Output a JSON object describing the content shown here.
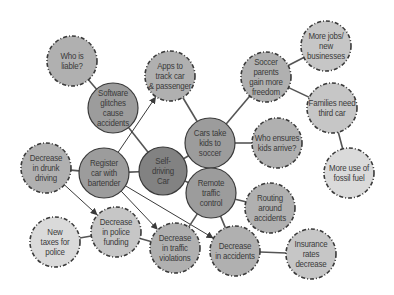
{
  "diagram": {
    "colors": {
      "background": "#ffffff",
      "center_fill": "#828282",
      "level1_fill": "#9c9c9c",
      "level2_fill": "#b0b0b0",
      "level3_fill": "#c6c6c6",
      "leaf_fill": "#dadada",
      "stroke": "#3a3a3a",
      "edge": "#555555",
      "text": "#3a3a3a"
    },
    "nodes": [
      {
        "id": "self-driving-car",
        "label": "Self-\ndriving\nCar",
        "cx": 163,
        "cy": 171,
        "r": 24,
        "level": "center",
        "dashed": false
      },
      {
        "id": "software-glitches",
        "label": "Software\nglitches\ncause\naccidents",
        "cx": 113,
        "cy": 108,
        "r": 25,
        "level": "level1",
        "dashed": false
      },
      {
        "id": "register-car",
        "label": "Register\ncar with\nbartender",
        "cx": 104,
        "cy": 173,
        "r": 25,
        "level": "level1",
        "dashed": false
      },
      {
        "id": "cars-take-kids",
        "label": "Cars take\nkids to\nsoccer",
        "cx": 210,
        "cy": 143,
        "r": 25,
        "level": "level1",
        "dashed": false
      },
      {
        "id": "remote-traffic",
        "label": "Remote\ntraffic\ncontrol",
        "cx": 211,
        "cy": 193,
        "r": 25,
        "level": "level1",
        "dashed": false
      },
      {
        "id": "who-is-liable",
        "label": "Who is\nliable?",
        "cx": 72,
        "cy": 61,
        "r": 25,
        "level": "level2",
        "dashed": true
      },
      {
        "id": "apps-to-track",
        "label": "Apps to\ntrack car\n& passenger",
        "cx": 170,
        "cy": 76,
        "r": 25,
        "level": "level2",
        "dashed": true
      },
      {
        "id": "soccer-parents",
        "label": "Soccer\nparents\ngain more\nfreedom",
        "cx": 266,
        "cy": 77,
        "r": 25,
        "level": "level2",
        "dashed": true
      },
      {
        "id": "who-ensures-kids",
        "label": "Who ensures\nkids arrive?",
        "cx": 277,
        "cy": 143,
        "r": 25,
        "level": "level2",
        "dashed": true
      },
      {
        "id": "routing-around",
        "label": "Routing\naround\naccidents",
        "cx": 270,
        "cy": 208,
        "r": 25,
        "level": "level2",
        "dashed": true
      },
      {
        "id": "decrease-drunk",
        "label": "Decrease\nin drunk\ndriving",
        "cx": 46,
        "cy": 168,
        "r": 25,
        "level": "level2",
        "dashed": true
      },
      {
        "id": "decrease-violations",
        "label": "Decrease\nin traffic\nviolations",
        "cx": 175,
        "cy": 248,
        "r": 25,
        "level": "level2",
        "dashed": true
      },
      {
        "id": "decrease-accidents",
        "label": "Decrease\nin accidents",
        "cx": 235,
        "cy": 251,
        "r": 25,
        "level": "level2",
        "dashed": true
      },
      {
        "id": "more-jobs",
        "label": "More jobs/\nnew\nbusinesses",
        "cx": 326,
        "cy": 46,
        "r": 25,
        "level": "level3",
        "dashed": true
      },
      {
        "id": "families-third-car",
        "label": "Families need\nthird car",
        "cx": 332,
        "cy": 108,
        "r": 25,
        "level": "level3",
        "dashed": true
      },
      {
        "id": "decrease-police-funding",
        "label": "Decrease\nin police\nfunding",
        "cx": 116,
        "cy": 232,
        "r": 25,
        "level": "level3",
        "dashed": true
      },
      {
        "id": "insurance-rates",
        "label": "Insurance\nrates\ndecrease",
        "cx": 311,
        "cy": 254,
        "r": 25,
        "level": "level3",
        "dashed": true
      },
      {
        "id": "new-taxes",
        "label": "New\ntaxes for\npolice",
        "cx": 55,
        "cy": 242,
        "r": 25,
        "level": "leaf",
        "dashed": true
      },
      {
        "id": "fossil-fuel",
        "label": "More use of\nfossil fuel",
        "cx": 349,
        "cy": 173,
        "r": 25,
        "level": "leaf",
        "dashed": true
      }
    ],
    "edges": [
      {
        "from": "self-driving-car",
        "to": "software-glitches",
        "arrow": false
      },
      {
        "from": "self-driving-car",
        "to": "register-car",
        "arrow": false
      },
      {
        "from": "self-driving-car",
        "to": "cars-take-kids",
        "arrow": false
      },
      {
        "from": "self-driving-car",
        "to": "remote-traffic",
        "arrow": false
      },
      {
        "from": "software-glitches",
        "to": "who-is-liable",
        "arrow": false
      },
      {
        "from": "register-car",
        "to": "apps-to-track",
        "arrow": true
      },
      {
        "from": "register-car",
        "to": "decrease-drunk",
        "arrow": false
      },
      {
        "from": "register-car",
        "to": "decrease-violations",
        "arrow": true
      },
      {
        "from": "register-car",
        "to": "decrease-accidents",
        "arrow": true
      },
      {
        "from": "decrease-drunk",
        "to": "decrease-police-funding",
        "arrow": true
      },
      {
        "from": "decrease-police-funding",
        "to": "new-taxes",
        "arrow": false
      },
      {
        "from": "decrease-police-funding",
        "to": "decrease-violations",
        "arrow": false
      },
      {
        "from": "cars-take-kids",
        "to": "apps-to-track",
        "arrow": false
      },
      {
        "from": "cars-take-kids",
        "to": "soccer-parents",
        "arrow": false
      },
      {
        "from": "cars-take-kids",
        "to": "who-ensures-kids",
        "arrow": false
      },
      {
        "from": "soccer-parents",
        "to": "more-jobs",
        "arrow": false
      },
      {
        "from": "soccer-parents",
        "to": "families-third-car",
        "arrow": false
      },
      {
        "from": "families-third-car",
        "to": "fossil-fuel",
        "arrow": false
      },
      {
        "from": "remote-traffic",
        "to": "routing-around",
        "arrow": false
      },
      {
        "from": "remote-traffic",
        "to": "decrease-violations",
        "arrow": false
      },
      {
        "from": "remote-traffic",
        "to": "decrease-accidents",
        "arrow": false
      },
      {
        "from": "decrease-accidents",
        "to": "insurance-rates",
        "arrow": false
      }
    ]
  }
}
